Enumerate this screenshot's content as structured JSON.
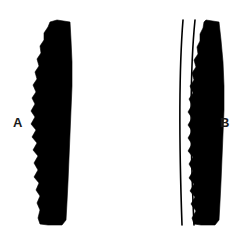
{
  "figure": {
    "background_color": "#ffffff",
    "ink_color": "#000000",
    "width": 250,
    "height": 238,
    "specimens": [
      {
        "label": "A",
        "label_x": 13,
        "label_y": 116,
        "description": "elongate curved element, crenulate left margin, smooth convex right margin",
        "outline_path": "M 57 20 L 70 22 L 71 40 L 72 62 L 72 86 L 71 110 L 70 134 L 69 158 L 68 182 L 67 202 L 66 220 L 62 225 L 48 225 L 40 224 L 38 218 L 40 210 L 37 203 L 40 196 L 36 190 L 39 183 L 34 177 L 38 170 L 34 163 L 38 156 L 33 150 L 37 143 L 32 137 L 36 130 L 31 124 L 35 117 L 31 111 L 35 104 L 32 98 L 36 92 L 33 85 L 37 79 L 35 72 L 39 66 L 37 59 L 41 53 L 40 46 L 44 40 L 44 33 L 48 27 L 50 22 Z",
        "serration_side": "left",
        "serration_count": 13,
        "top_edge": "slanted",
        "bottom_edge": "slanted"
      },
      {
        "label": "B",
        "label_x": 220,
        "label_y": 116,
        "description": "elongate curved element, crenulate left margin, smooth convex right margin, with two thin arc lines at left",
        "outline_path": "M 206 20 L 219 22 L 221 40 L 223 62 L 224 86 L 224 110 L 223 134 L 222 158 L 221 182 L 220 202 L 219 220 L 215 225 L 201 225 L 194 224 L 192 218 L 196 211 L 191 204 L 195 197 L 190 191 L 194 184 L 189 178 L 193 171 L 189 164 L 193 157 L 188 151 L 192 144 L 188 138 L 192 131 L 188 125 L 192 118 L 188 112 L 192 105 L 189 99 L 193 93 L 190 86 L 194 80 L 192 73 L 196 67 L 194 60 L 198 54 L 197 47 L 200 41 L 200 34 L 203 28 L 204 22 Z",
        "serration_side": "left",
        "serration_count": 13,
        "top_edge": "slanted",
        "bottom_edge": "slanted",
        "arc_lines": [
          {
            "name": "outer-arc-line",
            "path": "M 183 20 C 179 70 179 140 182 225",
            "stroke_width": 1.6
          },
          {
            "name": "inner-arc-line",
            "path": "M 195 20 C 190 70 190 140 194 225",
            "stroke_width": 1.6
          }
        ]
      }
    ]
  }
}
